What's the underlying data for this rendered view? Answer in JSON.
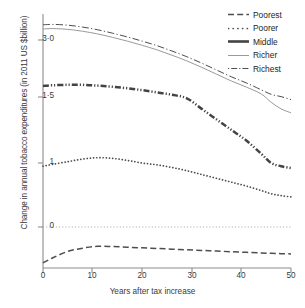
{
  "chart_data": {
    "type": "line",
    "title": "",
    "xlabel": "Years after tax increase",
    "ylabel": "Change in annual tobacco expenditures (in 2011 US $billion)",
    "xlim": [
      0,
      50
    ],
    "ylim": [
      -0.6,
      3.5
    ],
    "grid": false,
    "legend_position": "top-right",
    "x_ticks": [
      "0",
      "10",
      "20",
      "30",
      "40",
      "50"
    ],
    "x_tick_values": [
      0,
      10,
      20,
      30,
      40,
      50
    ],
    "y_ticks": [
      "0",
      "1",
      "1·5",
      "3·0"
    ],
    "y_tick_values": [
      0,
      1,
      1.5,
      3.0
    ],
    "zero_reference_line": 0,
    "x": [
      0,
      2,
      5,
      8,
      11,
      14,
      17,
      20,
      23,
      26,
      29,
      32,
      35,
      38,
      41,
      44,
      46,
      48,
      50
    ],
    "series": [
      {
        "name": "Poorest",
        "style": "dashed",
        "color": "#4d4d4d",
        "values": [
          -0.56,
          -0.48,
          -0.38,
          -0.33,
          -0.3,
          -0.305,
          -0.315,
          -0.325,
          -0.335,
          -0.345,
          -0.355,
          -0.365,
          -0.375,
          -0.385,
          -0.395,
          -0.405,
          -0.41,
          -0.415,
          -0.42
        ]
      },
      {
        "name": "Poorer",
        "style": "dotted",
        "color": "#4d4d4d",
        "values": [
          0.95,
          0.98,
          1.01,
          1.03,
          1.04,
          1.035,
          1.02,
          1.0,
          0.97,
          0.93,
          0.88,
          0.82,
          0.76,
          0.7,
          0.64,
          0.57,
          0.52,
          0.49,
          0.47
        ]
      },
      {
        "name": "Middle",
        "style": "dash-dot-dot-thick",
        "color": "#434343",
        "values": [
          1.79,
          1.81,
          1.82,
          1.82,
          1.8,
          1.77,
          1.73,
          1.68,
          1.62,
          1.56,
          1.49,
          1.41,
          1.33,
          1.25,
          1.17,
          1.07,
          1.0,
          0.95,
          0.92
        ]
      },
      {
        "name": "Richer",
        "style": "solid-thin",
        "color": "#9a9a9a",
        "values": [
          3.29,
          3.3,
          3.28,
          3.23,
          3.16,
          3.07,
          2.97,
          2.86,
          2.74,
          2.6,
          2.45,
          2.28,
          2.1,
          1.92,
          1.76,
          1.58,
          1.46,
          1.41,
          1.38
        ]
      },
      {
        "name": "Richest",
        "style": "dash-dot",
        "color": "#4d4d4d",
        "values": [
          3.4,
          3.41,
          3.39,
          3.34,
          3.27,
          3.18,
          3.08,
          2.97,
          2.85,
          2.71,
          2.56,
          2.39,
          2.21,
          2.03,
          1.87,
          1.69,
          1.57,
          1.51,
          1.48
        ]
      }
    ]
  },
  "axes": {
    "y_title": "Change in annual tobacco expenditures (in 2011 US $billion)",
    "x_title": "Years after tax increase"
  },
  "y_tick_labels": [
    "3·0",
    "1·5",
    "1",
    "0"
  ],
  "x_tick_labels": [
    "0",
    "10",
    "20",
    "30",
    "40",
    "50"
  ],
  "legend": {
    "items": [
      {
        "label": "Poorest",
        "key": "dashed-line-key"
      },
      {
        "label": "Poorer",
        "key": "dotted-line-key"
      },
      {
        "label": "Middle",
        "key": "thick-dash-dot-dot-line-key"
      },
      {
        "label": "Richer",
        "key": "thin-solid-line-key"
      },
      {
        "label": "Richest",
        "key": "dash-dot-line-key"
      }
    ]
  },
  "colors": {
    "axis": "#8c8c8c",
    "text": "#3a3a3a",
    "dark_line": "#4d4d4d",
    "light_line": "#9a9a9a"
  }
}
